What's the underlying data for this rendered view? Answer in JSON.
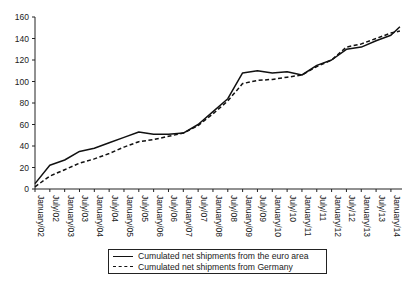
{
  "chart_data": {
    "type": "line",
    "title": "",
    "xlabel": "",
    "ylabel": "",
    "ylim": [
      0,
      160
    ],
    "yticks": [
      0,
      20,
      40,
      60,
      80,
      100,
      120,
      140,
      160
    ],
    "grid": false,
    "legend_position": "bottom-center",
    "categories": [
      "January/02",
      "July/02",
      "January/03",
      "July/03",
      "January/04",
      "July/04",
      "January/05",
      "July/05",
      "January/06",
      "July/06",
      "January/07",
      "July/07",
      "January/08",
      "July/08",
      "January/09",
      "July/09",
      "January/10",
      "July/10",
      "January/11",
      "July/11",
      "January/12",
      "July/12",
      "January/13",
      "July/13",
      "January/14"
    ],
    "series": [
      {
        "name": "Cumulated net shipments from the euro area",
        "style": "solid",
        "color": "#111111",
        "values": [
          5,
          22,
          27,
          35,
          38,
          43,
          48,
          53,
          51,
          51,
          52,
          60,
          72,
          84,
          108,
          110,
          108,
          109,
          106,
          115,
          120,
          130,
          132,
          138,
          143
        ],
        "end_value": 151
      },
      {
        "name": "Cumulated net shipments from Germany",
        "style": "dashed",
        "color": "#111111",
        "values": [
          2,
          12,
          18,
          24,
          28,
          33,
          39,
          44,
          46,
          49,
          52,
          59,
          70,
          82,
          98,
          101,
          102,
          104,
          106,
          114,
          120,
          132,
          135,
          140,
          145
        ],
        "end_value": 147
      }
    ]
  },
  "legend": {
    "items": [
      {
        "label": "Cumulated net shipments from the euro area",
        "style": "solid"
      },
      {
        "label": "Cumulated net shipments from Germany",
        "style": "dashed"
      }
    ]
  }
}
